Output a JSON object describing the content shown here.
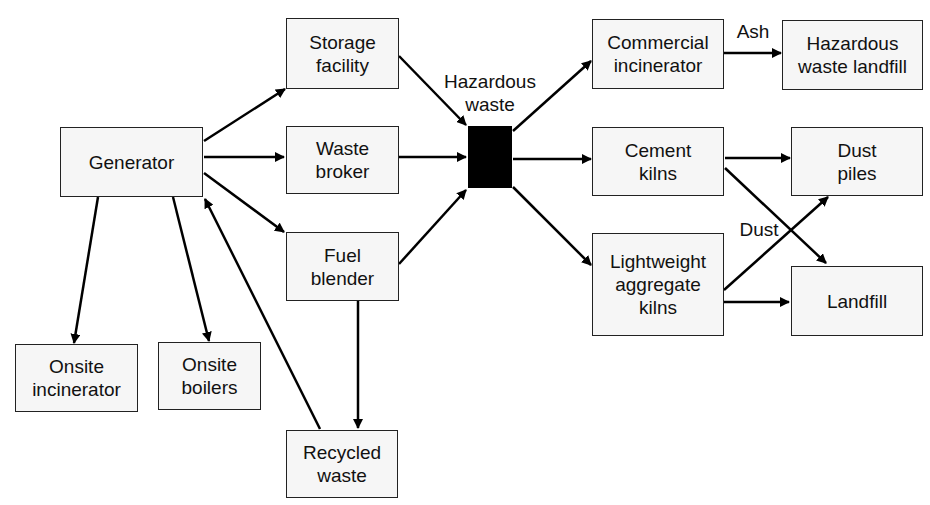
{
  "diagram": {
    "nodes": {
      "generator": "Generator",
      "storage_facility": "Storage\nfacility",
      "waste_broker": "Waste\nbroker",
      "fuel_blender": "Fuel\nblender",
      "onsite_incinerator": "Onsite\nincinerator",
      "onsite_boilers": "Onsite\nboilers",
      "recycled_waste": "Recycled\nwaste",
      "commercial_incinerator": "Commercial\nincinerator",
      "hazardous_waste_landfill": "Hazardous\nwaste landfill",
      "cement_kilns": "Cement\nkilns",
      "dust_piles": "Dust\npiles",
      "lightweight_aggregate_kilns": "Lightweight\naggregate\nkilns",
      "landfill": "Landfill"
    },
    "hub_label": "Hazardous\nwaste",
    "edge_labels": {
      "ash": "Ash",
      "dust": "Dust"
    },
    "edges": [
      {
        "from": "Generator",
        "to": "Storage facility"
      },
      {
        "from": "Generator",
        "to": "Waste broker"
      },
      {
        "from": "Generator",
        "to": "Fuel blender"
      },
      {
        "from": "Generator",
        "to": "Onsite incinerator"
      },
      {
        "from": "Generator",
        "to": "Onsite boilers"
      },
      {
        "from": "Recycled waste",
        "to": "Generator"
      },
      {
        "from": "Fuel blender",
        "to": "Recycled waste"
      },
      {
        "from": "Storage facility",
        "to": "Hazardous waste"
      },
      {
        "from": "Waste broker",
        "to": "Hazardous waste"
      },
      {
        "from": "Fuel blender",
        "to": "Hazardous waste"
      },
      {
        "from": "Hazardous waste",
        "to": "Commercial incinerator"
      },
      {
        "from": "Hazardous waste",
        "to": "Cement kilns"
      },
      {
        "from": "Hazardous waste",
        "to": "Lightweight aggregate kilns"
      },
      {
        "from": "Commercial incinerator",
        "to": "Hazardous waste landfill",
        "label": "Ash"
      },
      {
        "from": "Cement kilns",
        "to": "Dust piles"
      },
      {
        "from": "Cement kilns",
        "to": "Landfill"
      },
      {
        "from": "Lightweight aggregate kilns",
        "to": "Dust piles",
        "label": "Dust"
      },
      {
        "from": "Lightweight aggregate kilns",
        "to": "Landfill"
      }
    ],
    "colors": {
      "line": "#000000",
      "box_fill": "#f6f6f6",
      "box_border": "#222222",
      "hub_fill": "#000000"
    }
  }
}
